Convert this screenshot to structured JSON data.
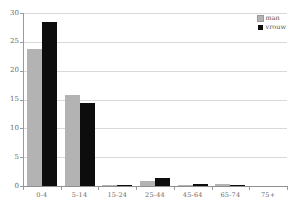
{
  "chart_data": {
    "type": "bar",
    "title": "",
    "xlabel": "",
    "ylabel": "",
    "categories": [
      "0-4",
      "5-14",
      "15-24",
      "25-44",
      "45-64",
      "65-74",
      "75+"
    ],
    "series": [
      {
        "name": "man",
        "color": "#b3b3b3",
        "values": [
          23.7,
          15.8,
          0.2,
          0.9,
          0.2,
          0.4,
          0
        ]
      },
      {
        "name": "vrouw",
        "color": "#0d0d0d",
        "values": [
          28.5,
          14.4,
          0.1,
          1.4,
          0.4,
          0.1,
          0
        ]
      }
    ],
    "ylim": [
      0,
      30
    ],
    "ytick_step": 5,
    "ytick_labels": [
      "0",
      "5",
      "10",
      "15",
      "20",
      "25",
      "30"
    ],
    "grid": true,
    "legend_position": "top-right"
  },
  "colors": {
    "background": "#ffffff",
    "gridline": "#d9d9d9",
    "axis": "#9a9a9a",
    "tick_label": "#6b6b6b",
    "legend_text": "#555555"
  }
}
